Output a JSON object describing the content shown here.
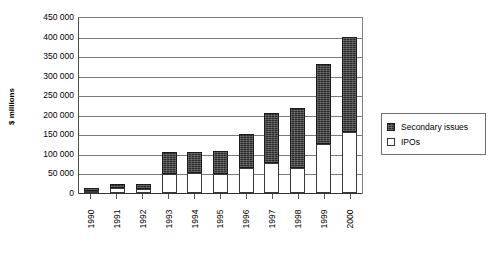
{
  "chart_data": {
    "type": "bar",
    "subtype": "stacked-column",
    "title": "",
    "xlabel": "",
    "ylabel": "$ millions",
    "ylim": [
      0,
      450000
    ],
    "ytick_step": 50000,
    "ytick_labels": [
      "450 000",
      "400 000",
      "350 000",
      "300 000",
      "250 000",
      "200 000",
      "150 000",
      "100 000",
      "50 000",
      "0"
    ],
    "ytick_values": [
      450000,
      400000,
      350000,
      300000,
      250000,
      200000,
      150000,
      100000,
      50000,
      0
    ],
    "grid": true,
    "legend_position": "right",
    "categories": [
      "1990",
      "1991",
      "1992",
      "1993",
      "1994",
      "1995",
      "1996",
      "1997",
      "1998",
      "1999",
      "2000"
    ],
    "series": [
      {
        "name": "IPOs",
        "color": "#ffffff",
        "values": [
          6000,
          12000,
          10000,
          48000,
          52000,
          48000,
          63000,
          78000,
          63000,
          125000,
          155000
        ]
      },
      {
        "name": "Secondary issues",
        "color": "#2b2b2b",
        "values": [
          7000,
          12000,
          14000,
          57000,
          53000,
          59000,
          89000,
          127000,
          154000,
          205000,
          243000
        ]
      }
    ],
    "totals": [
      13000,
      24000,
      24000,
      105000,
      105000,
      107000,
      152000,
      205000,
      217000,
      330000,
      398000
    ],
    "legend_order": [
      "Secondary issues",
      "IPOs"
    ]
  },
  "legend": {
    "items": [
      {
        "label": "Secondary issues",
        "swatch": "dark"
      },
      {
        "label": "IPOs",
        "swatch": "light"
      }
    ]
  },
  "caption_remnant": ""
}
